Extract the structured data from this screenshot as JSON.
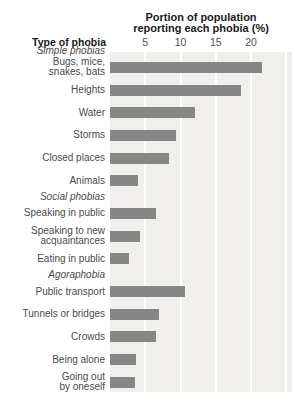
{
  "chart_data": {
    "type": "bar",
    "orientation": "horizontal",
    "title": "Portion of population reporting each phobia (%)",
    "title_lines": [
      "Portion of population",
      "reporting each phobia (%)"
    ],
    "xlabel": "Portion of population reporting each phobia (%)",
    "left_header": "Type of phobia",
    "xlim": [
      0,
      25.8
    ],
    "xticks": [
      5,
      10,
      15,
      20
    ],
    "gridlines": [
      5,
      10,
      15,
      20,
      25
    ],
    "grid": true,
    "legend": "none",
    "bar_color": "#868686",
    "plot_bg_color": "#f0efec",
    "groups": [
      {
        "name": "Simple phobias",
        "items": [
          {
            "label": "Bugs, mice,\nsnakes, bats",
            "value": 21.6
          },
          {
            "label": "Heights",
            "value": 18.5
          },
          {
            "label": "Water",
            "value": 12.1
          },
          {
            "label": "Storms",
            "value": 9.4
          },
          {
            "label": "Closed places",
            "value": 8.4
          },
          {
            "label": "Animals",
            "value": 4.0
          }
        ]
      },
      {
        "name": "Social phobias",
        "items": [
          {
            "label": "Speaking in public",
            "value": 6.5
          },
          {
            "label": "Speaking to new\nacquaintances",
            "value": 4.3
          },
          {
            "label": "Eating in public",
            "value": 2.7
          }
        ]
      },
      {
        "name": "Agoraphobia",
        "items": [
          {
            "label": "Public transport",
            "value": 10.6
          },
          {
            "label": "Tunnels or bridges",
            "value": 7.0
          },
          {
            "label": "Crowds",
            "value": 6.5
          },
          {
            "label": "Being alone",
            "value": 3.7
          },
          {
            "label": "Going out\nby oneself",
            "value": 3.5
          }
        ]
      }
    ]
  }
}
